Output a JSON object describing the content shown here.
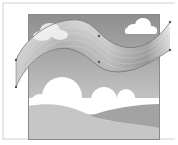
{
  "canvas": {
    "description": "Vector editor artboard showing a gradient ribbon path with anchor points over a grayscale landscape illustration",
    "colors": {
      "background": "#ffffff",
      "frame_border": "#d8d8d8",
      "sky_top": "#8f8f8f",
      "sky_bottom": "#c9c9c9",
      "cloud": "#ffffff",
      "hill_light": "#c4c4c4",
      "hill_dark": "#a2a2a2",
      "ribbon_light": "#efefef",
      "ribbon_dark": "#9a9a9a",
      "path_stroke": "#6a6a6a",
      "anchor": "#555555"
    }
  },
  "artwork": {
    "clouds_count": 2,
    "hills_count": 2,
    "ribbon": {
      "selected": true,
      "anchor_points_top": 4,
      "anchor_points_bottom": 4
    }
  }
}
